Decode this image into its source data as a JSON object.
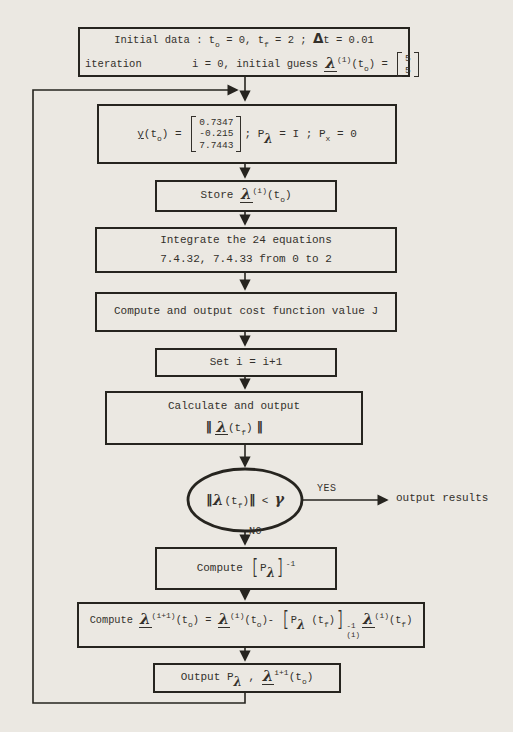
{
  "colors": {
    "background": "#ebe8e2",
    "ink": "#33302b",
    "line": "#26241f"
  },
  "flowchart": {
    "initial": {
      "line1": [
        {
          "t": "Initial data : t"
        },
        {
          "t": "o",
          "c": "sub"
        },
        {
          "t": " = 0, t"
        },
        {
          "t": "f",
          "c": "sub"
        },
        {
          "t": " = 2 ; "
        },
        {
          "t": "Δ",
          "c": "delta"
        },
        {
          "t": "t = 0.01"
        }
      ],
      "line2": [
        {
          "t": "iteration        i = 0, initial guess "
        },
        {
          "t": "λ",
          "c": "lamu"
        },
        {
          "t": "(1)",
          "c": "sup"
        },
        {
          "t": "(t"
        },
        {
          "t": "o",
          "c": "sub"
        },
        {
          "t": ") = "
        },
        {
          "rows": [
            "5",
            "5"
          ]
        }
      ]
    },
    "init_y": {
      "formula": [
        {
          "t": "y",
          "c": "ul"
        },
        {
          "t": "(t"
        },
        {
          "t": "o",
          "c": "sub"
        },
        {
          "t": ") = "
        },
        {
          "rows": [
            "0.7347",
            "-0.215",
            "7.7443"
          ]
        },
        {
          "t": "; P"
        },
        {
          "t": "λ",
          "c": "lams"
        },
        {
          "t": " = I ; P"
        },
        {
          "t": "x",
          "c": "sub"
        },
        {
          "t": " = 0"
        }
      ]
    },
    "store": {
      "formula": [
        {
          "t": "Store "
        },
        {
          "t": "λ",
          "c": "lamu"
        },
        {
          "t": "(i)",
          "c": "sup"
        },
        {
          "t": "(t"
        },
        {
          "t": "o",
          "c": "sub"
        },
        {
          "t": ")"
        }
      ]
    },
    "integrate": {
      "line1": "Integrate the 24 equations",
      "line2": "7.4.32, 7.4.33 from 0 to 2"
    },
    "cost": {
      "label": "Compute and output cost function value J"
    },
    "set_i": {
      "label": "Set i = i+1"
    },
    "calc_norm": {
      "line1": "Calculate and output",
      "line2": [
        {
          "t": "‖ ",
          "c": "norm"
        },
        {
          "t": "λ",
          "c": "lamu"
        },
        {
          "t": "(t"
        },
        {
          "t": "f",
          "c": "sub"
        },
        {
          "t": ")"
        },
        {
          "t": " ‖",
          "c": "norm"
        }
      ]
    },
    "decision": {
      "formula": [
        {
          "t": "‖",
          "c": "norm"
        },
        {
          "t": "λ",
          "c": "lamn"
        },
        {
          "t": "(t"
        },
        {
          "t": "f",
          "c": "sub"
        },
        {
          "t": ")"
        },
        {
          "t": "‖",
          "c": "norm"
        },
        {
          "t": " < "
        },
        {
          "t": "γ",
          "c": "gam"
        }
      ],
      "yes_label": "YES",
      "no_label": "NO",
      "yes_result": "output results"
    },
    "p_inverse": {
      "formula": [
        {
          "t": "Compute "
        },
        {
          "t": "[",
          "c": "br"
        },
        {
          "t": "P"
        },
        {
          "t": "λ",
          "c": "lams"
        },
        {
          "t": "]",
          "c": "br"
        },
        {
          "t": "-1",
          "c": "sup"
        }
      ]
    },
    "update": {
      "formula": [
        {
          "t": "Compute "
        },
        {
          "t": "λ",
          "c": "lamu"
        },
        {
          "t": "(i+1)",
          "c": "sup"
        },
        {
          "t": "(t"
        },
        {
          "t": "o",
          "c": "sub"
        },
        {
          "t": ") = "
        },
        {
          "t": "λ",
          "c": "lamu"
        },
        {
          "t": "(i)",
          "c": "sup"
        },
        {
          "t": "(t"
        },
        {
          "t": "o",
          "c": "sub"
        },
        {
          "t": ")- "
        },
        {
          "t": "[",
          "c": "br"
        },
        {
          "t": "P"
        },
        {
          "t": "λ",
          "c": "lams"
        },
        {
          "t": " (t"
        },
        {
          "t": "f",
          "c": "sub"
        },
        {
          "t": ")"
        },
        {
          "t": "]",
          "c": "br"
        },
        {
          "sup": "-1",
          "sub": "(i)"
        },
        {
          "t": "λ",
          "c": "lamu"
        },
        {
          "t": "(i)",
          "c": "sup"
        },
        {
          "t": "(t"
        },
        {
          "t": "f",
          "c": "sub"
        },
        {
          "t": ")"
        }
      ]
    },
    "output": {
      "formula": [
        {
          "t": "Output P"
        },
        {
          "t": "λ",
          "c": "lams"
        },
        {
          "t": " , "
        },
        {
          "t": "λ",
          "c": "lamu"
        },
        {
          "t": "i+1",
          "c": "sup"
        },
        {
          "t": "(t"
        },
        {
          "t": "o",
          "c": "sub"
        },
        {
          "t": ")"
        }
      ]
    }
  }
}
